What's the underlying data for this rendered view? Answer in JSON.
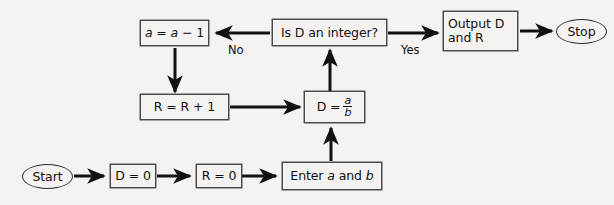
{
  "diagram": {
    "background_color": "#f4f3f1",
    "stroke_color": "#111111",
    "box_border_color": "#4a4a4a"
  },
  "nodes": {
    "start": {
      "label": "Start",
      "shape": "terminator"
    },
    "d_init": {
      "label": "D = 0",
      "shape": "process"
    },
    "r_init": {
      "label": "R = 0",
      "shape": "process"
    },
    "enter_ab": {
      "label_pre": "Enter ",
      "label_a": "a",
      "label_mid": " and ",
      "label_b": "b",
      "shape": "process"
    },
    "divide": {
      "label_lead": "D =",
      "numerator": "a",
      "denominator": "b",
      "shape": "process"
    },
    "decision": {
      "label": "Is D an integer?",
      "shape": "process"
    },
    "decrement_a": {
      "label_a1": "a",
      "label_eq": " = ",
      "label_a2": "a",
      "label_rest": " − 1",
      "shape": "process"
    },
    "increment_r": {
      "label": "R = R + 1",
      "shape": "process"
    },
    "output": {
      "label": "Output D\nand R",
      "shape": "process"
    },
    "stop": {
      "label": "Stop",
      "shape": "terminator"
    }
  },
  "edges": {
    "start_to_d": {
      "label": ""
    },
    "d_to_r": {
      "label": ""
    },
    "r_to_enter": {
      "label": ""
    },
    "enter_to_divide": {
      "label": ""
    },
    "divide_to_decision": {
      "label": ""
    },
    "decision_to_decrement": {
      "label": "No"
    },
    "decision_to_output": {
      "label": "Yes"
    },
    "decrement_to_increment": {
      "label": ""
    },
    "increment_to_divide": {
      "label": ""
    },
    "output_to_stop": {
      "label": ""
    }
  }
}
